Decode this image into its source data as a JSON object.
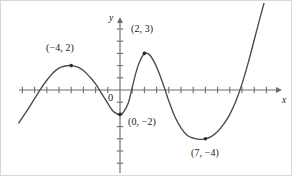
{
  "figure": {
    "title": "",
    "background_color": "#ffffff",
    "curve_color": "#4a4a4a",
    "axis_color": "#6e6e6e",
    "text_color": "#1a1a1a",
    "width": 292,
    "height": 176
  },
  "axes": {
    "x_label": "x",
    "y_label": "y",
    "origin_label": "0",
    "origin_px": {
      "x": 119,
      "y": 89
    },
    "unit_px": 12.2,
    "x_axis": {
      "start_px": 18,
      "end_px": 281,
      "arrow": "right"
    },
    "y_axis": {
      "start_px": 16,
      "end_px": 172,
      "arrow": "up"
    },
    "tick_marks": true,
    "tick_labels_shown": false,
    "grid": false
  },
  "chart_data": {
    "type": "line",
    "title": "",
    "xlabel": "x",
    "ylabel": "y",
    "grid": false,
    "legend": null,
    "xlim": [
      -8.3,
      13.3
    ],
    "ylim": [
      -6.0,
      6.0
    ],
    "annotations": [
      {
        "label": "(−4, 2)",
        "x": -4,
        "y": 2,
        "marker": true,
        "label_px": {
          "x": 45,
          "y": 42
        }
      },
      {
        "label": "(2, 3)",
        "x": 2,
        "y": 3,
        "marker": true,
        "label_px": {
          "x": 130,
          "y": 23
        }
      },
      {
        "label": "(0, −2)",
        "x": 0,
        "y": -2,
        "marker": true,
        "label_px": {
          "x": 127,
          "y": 116
        }
      },
      {
        "label": "(7, −4)",
        "x": 7,
        "y": -4,
        "marker": true,
        "label_px": {
          "x": 190,
          "y": 147
        }
      }
    ],
    "points": [
      {
        "x": -8.3,
        "y": -2.7
      },
      {
        "x": -7.5,
        "y": -1.5
      },
      {
        "x": -7.0,
        "y": -0.7
      },
      {
        "x": -6.5,
        "y": 0.1
      },
      {
        "x": -6.0,
        "y": 0.8
      },
      {
        "x": -5.5,
        "y": 1.4
      },
      {
        "x": -5.0,
        "y": 1.8
      },
      {
        "x": -4.5,
        "y": 1.97
      },
      {
        "x": -4.0,
        "y": 2.0
      },
      {
        "x": -3.5,
        "y": 1.9
      },
      {
        "x": -3.0,
        "y": 1.6
      },
      {
        "x": -2.5,
        "y": 1.1
      },
      {
        "x": -2.0,
        "y": 0.5
      },
      {
        "x": -1.5,
        "y": -0.3
      },
      {
        "x": -1.0,
        "y": -1.1
      },
      {
        "x": -0.6,
        "y": -1.7
      },
      {
        "x": -0.2,
        "y": -1.97
      },
      {
        "x": 0.0,
        "y": -2.0
      },
      {
        "x": 0.3,
        "y": -1.8
      },
      {
        "x": 0.7,
        "y": -1.0
      },
      {
        "x": 1.0,
        "y": 0.2
      },
      {
        "x": 1.3,
        "y": 1.4
      },
      {
        "x": 1.6,
        "y": 2.3
      },
      {
        "x": 2.0,
        "y": 3.0
      },
      {
        "x": 2.4,
        "y": 2.9
      },
      {
        "x": 2.8,
        "y": 2.3
      },
      {
        "x": 3.2,
        "y": 1.4
      },
      {
        "x": 3.6,
        "y": 0.3
      },
      {
        "x": 4.0,
        "y": -0.9
      },
      {
        "x": 4.5,
        "y": -2.2
      },
      {
        "x": 5.0,
        "y": -3.1
      },
      {
        "x": 5.5,
        "y": -3.7
      },
      {
        "x": 6.0,
        "y": -3.95
      },
      {
        "x": 6.5,
        "y": -4.05
      },
      {
        "x": 7.0,
        "y": -4.0
      },
      {
        "x": 7.5,
        "y": -3.8
      },
      {
        "x": 8.0,
        "y": -3.4
      },
      {
        "x": 8.5,
        "y": -2.8
      },
      {
        "x": 9.0,
        "y": -2.0
      },
      {
        "x": 9.5,
        "y": -0.9
      },
      {
        "x": 10.0,
        "y": 0.5
      },
      {
        "x": 10.5,
        "y": 2.2
      },
      {
        "x": 11.0,
        "y": 4.1
      },
      {
        "x": 11.5,
        "y": 6.0
      },
      {
        "x": 11.8,
        "y": 7.1
      }
    ]
  }
}
